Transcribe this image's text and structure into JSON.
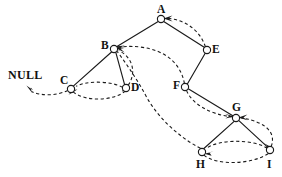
{
  "figure": {
    "background_color": "#ffffff",
    "ink_color": "#1a1a1a",
    "width": 282,
    "height": 177
  },
  "null_marker": {
    "label": "NULL",
    "x": 8,
    "y": 69
  },
  "nodes": [
    {
      "id": "A",
      "label": "A",
      "cx": 161,
      "cy": 19,
      "r": 3.6,
      "label_x": 157,
      "label_y": 4
    },
    {
      "id": "B",
      "label": "B",
      "cx": 114,
      "cy": 49,
      "r": 3.6,
      "label_x": 101,
      "label_y": 40
    },
    {
      "id": "C",
      "label": "C",
      "cx": 71,
      "cy": 89,
      "r": 3.6,
      "label_x": 60,
      "label_y": 75
    },
    {
      "id": "D",
      "label": "D",
      "cx": 126,
      "cy": 88,
      "r": 3.6,
      "label_x": 131,
      "label_y": 82
    },
    {
      "id": "E",
      "label": "E",
      "cx": 207,
      "cy": 50,
      "r": 3.6,
      "label_x": 212,
      "label_y": 44
    },
    {
      "id": "F",
      "label": "F",
      "cx": 185,
      "cy": 87,
      "r": 3.6,
      "label_x": 173,
      "label_y": 80
    },
    {
      "id": "G",
      "label": "G",
      "cx": 236,
      "cy": 118,
      "r": 3.6,
      "label_x": 232,
      "label_y": 102
    },
    {
      "id": "H",
      "label": "H",
      "cx": 202,
      "cy": 152,
      "r": 3.6,
      "label_x": 196,
      "label_y": 159
    },
    {
      "id": "I",
      "label": "I",
      "cx": 270,
      "cy": 150,
      "r": 3.6,
      "label_x": 267,
      "label_y": 159
    }
  ],
  "tree_edges": [
    {
      "from": "A",
      "to": "B",
      "kind": "left-child"
    },
    {
      "from": "A",
      "to": "E",
      "kind": "right-child"
    },
    {
      "from": "B",
      "to": "C",
      "kind": "left-child"
    },
    {
      "from": "B",
      "to": "D",
      "kind": "right-child"
    },
    {
      "from": "E",
      "to": "F",
      "kind": "left-child"
    },
    {
      "from": "F",
      "to": "G",
      "kind": "right-child"
    },
    {
      "from": "G",
      "to": "H",
      "kind": "left-child"
    },
    {
      "from": "G",
      "to": "I",
      "kind": "right-child"
    }
  ],
  "thread_edges": [
    {
      "from": "C",
      "to": "NULL",
      "kind": "inorder-predecessor"
    },
    {
      "from": "C",
      "to": "D",
      "kind": "inorder-successor"
    },
    {
      "from": "D",
      "to": "C",
      "kind": "inorder-predecessor"
    },
    {
      "from": "D",
      "to": "B",
      "kind": "inorder-successor"
    },
    {
      "from": "E",
      "to": "A",
      "kind": "inorder-predecessor"
    },
    {
      "from": "F",
      "to": "B",
      "kind": "inorder-successor"
    },
    {
      "from": "F",
      "to": "G",
      "kind": "inorder-successor"
    },
    {
      "from": "H",
      "to": "B",
      "kind": "inorder-predecessor"
    },
    {
      "from": "H",
      "to": "I",
      "kind": "inorder-successor"
    },
    {
      "from": "I",
      "to": "H",
      "kind": "inorder-predecessor"
    },
    {
      "from": "I",
      "to": "G",
      "kind": "inorder-successor"
    }
  ]
}
